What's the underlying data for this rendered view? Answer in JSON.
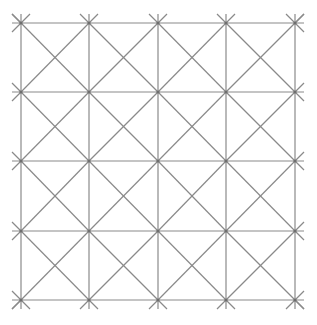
{
  "diagram": {
    "title": "",
    "type": "square lattice with diagonal lines",
    "background": "#ffffff",
    "line_color": "#8a8a8a",
    "line_width": 1.2,
    "grid": {
      "columns_x": [
        21,
        89,
        158,
        226,
        295
      ],
      "rows_y": [
        23,
        92,
        161,
        231,
        300
      ],
      "overhang": 9
    },
    "node_color": "#6e6e6e"
  }
}
